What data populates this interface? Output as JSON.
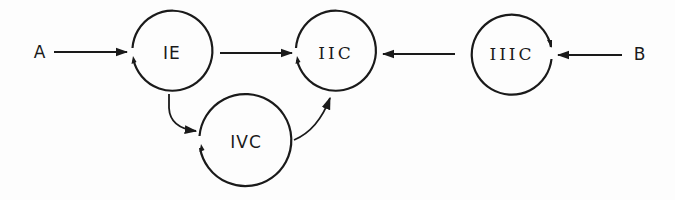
{
  "diagram": {
    "type": "state-transition",
    "colors": {
      "stroke": "#1a1a1a",
      "background": "#fdfdfd"
    },
    "inputs": [
      {
        "id": "A",
        "label": "A",
        "target": "IE"
      },
      {
        "id": "B",
        "label": "B",
        "target": "IIIC"
      }
    ],
    "nodes": [
      {
        "id": "IE",
        "label": "IE"
      },
      {
        "id": "IIC",
        "label": "IIC"
      },
      {
        "id": "IIIC",
        "label": "IIIC"
      },
      {
        "id": "IVC",
        "label": "IVC"
      }
    ],
    "edges": [
      {
        "from": "A",
        "to": "IE"
      },
      {
        "from": "IE",
        "to": "IIC"
      },
      {
        "from": "IIIC",
        "to": "IIC"
      },
      {
        "from": "B",
        "to": "IIIC"
      },
      {
        "from": "IE",
        "to": "IVC"
      },
      {
        "from": "IVC",
        "to": "IIC"
      },
      {
        "from": "IE",
        "to": "IE",
        "type": "self-loop"
      },
      {
        "from": "IIC",
        "to": "IIC",
        "type": "self-loop"
      },
      {
        "from": "IIIC",
        "to": "IIIC",
        "type": "self-loop"
      },
      {
        "from": "IVC",
        "to": "IVC",
        "type": "self-loop"
      }
    ]
  }
}
